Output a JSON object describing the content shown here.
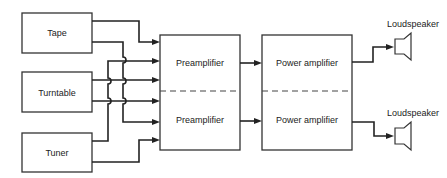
{
  "diagram": {
    "sources": [
      {
        "id": "tape",
        "label": "Tape"
      },
      {
        "id": "turntable",
        "label": "Turntable"
      },
      {
        "id": "tuner",
        "label": "Tuner"
      }
    ],
    "preamplifiers": [
      {
        "id": "preamp-top",
        "label": "Preamplifier"
      },
      {
        "id": "preamp-bottom",
        "label": "Preamplifier"
      }
    ],
    "power_amplifiers": [
      {
        "id": "power-top",
        "label": "Power amplifier"
      },
      {
        "id": "power-bottom",
        "label": "Power amplifier"
      }
    ],
    "loudspeakers": [
      {
        "id": "speaker-top",
        "label": "Loudspeaker"
      },
      {
        "id": "speaker-bottom",
        "label": "Loudspeaker"
      }
    ],
    "colors": {
      "line": "#222222",
      "background": "#ffffff"
    }
  }
}
